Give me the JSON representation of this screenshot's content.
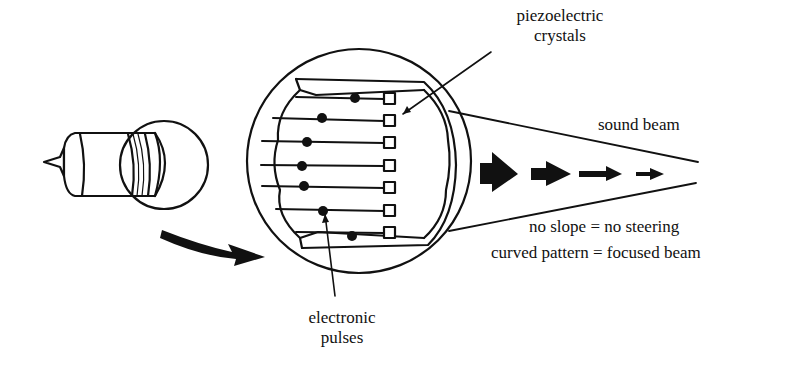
{
  "diagram": {
    "type": "ultrasound transducer array schematic",
    "labels": {
      "piezo_line1": "piezoelectric",
      "piezo_line2": "crystals",
      "sound_beam": "sound beam",
      "steering": "no slope = no steering",
      "focus": "curved pattern = focused beam",
      "pulses_line1": "electronic",
      "pulses_line2": "pulses"
    },
    "elements": {
      "crystal_count": 7,
      "pulse_dot_offsets": [
        355,
        322,
        307,
        302,
        304,
        323,
        352
      ]
    },
    "colors": {
      "ink": "#111111",
      "background": "#ffffff"
    }
  }
}
